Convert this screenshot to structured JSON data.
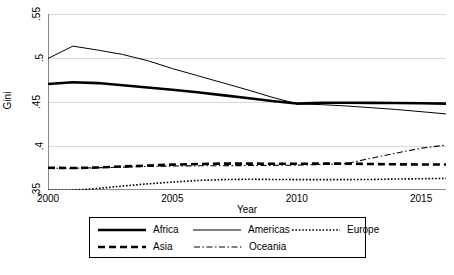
{
  "chart_data": {
    "type": "line",
    "title": "",
    "xlabel": "Year",
    "ylabel": "Gini",
    "xlim": [
      2000,
      2016
    ],
    "ylim": [
      0.35,
      0.55
    ],
    "xticks": [
      2000,
      2005,
      2010,
      2015
    ],
    "xticklabels": [
      "2000",
      "2005",
      "2010",
      "2015"
    ],
    "yticks": [
      0.35,
      0.4,
      0.45,
      0.5,
      0.55
    ],
    "yticklabels": [
      ".35",
      ".4",
      ".45",
      ".5",
      ".55"
    ],
    "grid": "horizontal",
    "legend_position": "bottom",
    "x": [
      2000,
      2001,
      2002,
      2003,
      2004,
      2005,
      2006,
      2007,
      2008,
      2009,
      2010,
      2011,
      2012,
      2013,
      2014,
      2015,
      2016
    ],
    "series": [
      {
        "name": "Africa",
        "style": "thick-solid",
        "color": "#000000",
        "values": [
          0.4705,
          0.4725,
          0.4715,
          0.469,
          0.4665,
          0.464,
          0.461,
          0.4578,
          0.4545,
          0.4512,
          0.4482,
          0.4492,
          0.4492,
          0.449,
          0.4488,
          0.4486,
          0.4482
        ]
      },
      {
        "name": "Americas",
        "style": "thin-solid",
        "color": "#000000",
        "values": [
          0.4995,
          0.5135,
          0.509,
          0.504,
          0.497,
          0.488,
          0.48,
          0.472,
          0.464,
          0.4555,
          0.448,
          0.447,
          0.4455,
          0.4435,
          0.4415,
          0.439,
          0.4365
        ]
      },
      {
        "name": "Asia",
        "style": "thick-dashed",
        "color": "#000000",
        "values": [
          0.3752,
          0.375,
          0.3755,
          0.3768,
          0.3778,
          0.3788,
          0.3795,
          0.38,
          0.38,
          0.3798,
          0.3798,
          0.38,
          0.38,
          0.3795,
          0.3792,
          0.379,
          0.379
        ]
      },
      {
        "name": "Europe",
        "style": "dotted",
        "color": "#000000",
        "values": [
          0.3498,
          0.3498,
          0.3518,
          0.3545,
          0.357,
          0.359,
          0.3608,
          0.3618,
          0.3622,
          0.362,
          0.3618,
          0.3618,
          0.3618,
          0.362,
          0.3625,
          0.3628,
          0.3632
        ]
      },
      {
        "name": "Oceania",
        "style": "dash-dot",
        "color": "#000000",
        "values": [
          0.3748,
          0.3748,
          0.3752,
          0.376,
          0.3768,
          0.3772,
          0.3775,
          0.3776,
          0.3778,
          0.378,
          0.3782,
          0.379,
          0.38,
          0.3862,
          0.392,
          0.3975,
          0.401
        ]
      }
    ]
  },
  "legend": {
    "rows": [
      [
        {
          "label": "Africa",
          "style": "thick-solid"
        },
        {
          "label": "Americas",
          "style": "thin-solid"
        },
        {
          "label": "Europe",
          "style": "dotted"
        }
      ],
      [
        {
          "label": "Asia",
          "style": "thick-dashed"
        },
        {
          "label": "Oceania",
          "style": "dash-dot"
        }
      ]
    ]
  },
  "axes": {
    "axis_color": "#8a8a8a",
    "grid_color": "#d9d9d9",
    "plot_bg": "#ffffff"
  }
}
